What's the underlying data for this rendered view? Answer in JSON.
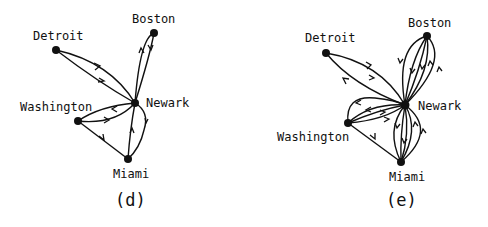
{
  "panels": [
    {
      "caption": "(d)",
      "nodes": [
        {
          "name": "Detroit",
          "x": 56,
          "y": 50,
          "lx": 33,
          "ly": 40
        },
        {
          "name": "Boston",
          "x": 154,
          "y": 33,
          "lx": 132,
          "ly": 23
        },
        {
          "name": "Newark",
          "x": 135,
          "y": 103,
          "lx": 146,
          "ly": 107
        },
        {
          "name": "Washington",
          "x": 78,
          "y": 121,
          "lx": 20,
          "ly": 111
        },
        {
          "name": "Miami",
          "x": 128,
          "y": 159,
          "lx": 113,
          "ly": 178
        }
      ]
    },
    {
      "caption": "(e)",
      "nodes": [
        {
          "name": "Detroit",
          "x": 326,
          "y": 53,
          "lx": 305,
          "ly": 42
        },
        {
          "name": "Boston",
          "x": 427,
          "y": 36,
          "lx": 408,
          "ly": 27
        },
        {
          "name": "Newark",
          "x": 405,
          "y": 105,
          "lx": 418,
          "ly": 110
        },
        {
          "name": "Washington",
          "x": 348,
          "y": 123,
          "lx": 277,
          "ly": 141
        },
        {
          "name": "Miami",
          "x": 401,
          "y": 162,
          "lx": 389,
          "ly": 181
        }
      ]
    }
  ]
}
